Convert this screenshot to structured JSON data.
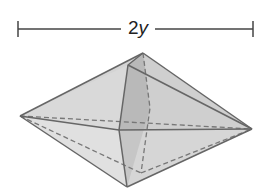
{
  "diagram": {
    "type": "geometric-solid",
    "shape": "square bipyramid (octahedron-like) in perspective",
    "dimension": {
      "coefficient": "2",
      "variable": "y",
      "full_label": "2y"
    },
    "colors": {
      "face_light": "#d8d8d8",
      "face_mid": "#c6c6c6",
      "face_dark": "#a9a9a9",
      "edge": "#666666",
      "dimension_line": "#444444"
    }
  }
}
